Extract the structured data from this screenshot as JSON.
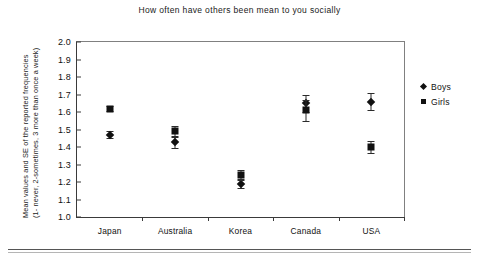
{
  "chart_data": {
    "type": "scatter",
    "title": "How often have others been mean to you socially",
    "xlabel": "",
    "ylabel_line1": "Mean values and SE of the reported frequencies",
    "ylabel_line2": "(1- never, 2-sometimes, 3 more than once a week)",
    "categories": [
      "Japan",
      "Australia",
      "Korea",
      "Canada",
      "USA"
    ],
    "ylim": [
      1.0,
      2.0
    ],
    "yticks": [
      "2.0",
      "1.9",
      "1.8",
      "1.7",
      "1.6",
      "1.5",
      "1.4",
      "1.3",
      "1.2",
      "1.1",
      "1.0"
    ],
    "ytick_values": [
      2.0,
      1.9,
      1.8,
      1.7,
      1.6,
      1.5,
      1.4,
      1.3,
      1.2,
      1.1,
      1.0
    ],
    "grid": false,
    "legend_position": "right",
    "series": [
      {
        "name": "Boys",
        "marker": "diamond",
        "color": "#111111",
        "values": [
          1.47,
          1.43,
          1.19,
          1.65,
          1.66
        ],
        "errors": [
          0.02,
          0.035,
          0.025,
          0.05,
          0.05
        ]
      },
      {
        "name": "Girls",
        "marker": "square",
        "color": "#111111",
        "values": [
          1.62,
          1.49,
          1.24,
          1.61,
          1.4
        ],
        "errors": [
          0.015,
          0.03,
          0.03,
          0.06,
          0.035
        ]
      }
    ]
  },
  "legend": {
    "items": [
      {
        "label": "Boys",
        "marker": "diamond"
      },
      {
        "label": "Girls",
        "marker": "square"
      }
    ]
  }
}
